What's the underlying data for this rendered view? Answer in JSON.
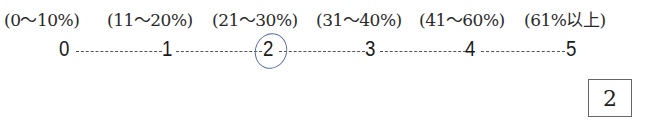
{
  "ranges": [
    {
      "label": "(0～10%)",
      "x": 4
    },
    {
      "label": "(11～20%)",
      "x": 107
    },
    {
      "label": "(21～30%)",
      "x": 212
    },
    {
      "label": "(31～40%)",
      "x": 316
    },
    {
      "label": "(41～60%)",
      "x": 419
    },
    {
      "label": "(61%以上)",
      "x": 524
    }
  ],
  "scale": {
    "numbers": [
      "0",
      "1",
      "2",
      "3",
      "4",
      "5"
    ],
    "selected": "2"
  },
  "answer": "2"
}
